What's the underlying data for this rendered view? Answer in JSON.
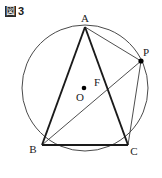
{
  "figure": {
    "caption_box_char": "図",
    "caption_number": "3",
    "type": "euclidean-geometry-diagram"
  },
  "colors": {
    "stroke": "#1a1a1a",
    "thin_stroke": "#3a3a3a",
    "circle_stroke": "#4a4a4a",
    "background": "#ffffff",
    "dot_fill": "#000000"
  },
  "geometry": {
    "circle": {
      "cx": 85,
      "cy": 88,
      "r": 63,
      "stroke_width": 1
    },
    "points": [
      {
        "name": "A",
        "x": 85,
        "y": 27,
        "label": "A",
        "label_x": 85,
        "label_y": 22,
        "dot": false
      },
      {
        "name": "B",
        "x": 42,
        "y": 145,
        "label": "B",
        "label_x": 33,
        "label_y": 153,
        "dot": false
      },
      {
        "name": "C",
        "x": 128,
        "y": 145,
        "label": "C",
        "label_x": 134,
        "label_y": 155,
        "dot": false
      },
      {
        "name": "P",
        "x": 141,
        "y": 61,
        "label": "P",
        "label_x": 146,
        "label_y": 56,
        "dot": true
      },
      {
        "name": "O",
        "x": 84,
        "y": 88,
        "label": "O",
        "label_x": 80,
        "label_y": 101,
        "dot": true
      },
      {
        "name": "F",
        "x": 104,
        "y": 88,
        "label": "F",
        "label_x": 97,
        "label_y": 86,
        "dot": false
      }
    ],
    "segments": [
      {
        "name": "AB",
        "from": "A",
        "to": "B",
        "weight": "thick"
      },
      {
        "name": "AC",
        "from": "A",
        "to": "C",
        "weight": "thick"
      },
      {
        "name": "BC",
        "from": "B",
        "to": "C",
        "weight": "thick"
      },
      {
        "name": "AP",
        "from": "A",
        "to": "P",
        "weight": "thin"
      },
      {
        "name": "BP",
        "from": "B",
        "to": "P",
        "weight": "thin"
      },
      {
        "name": "PC",
        "from": "P",
        "to": "C",
        "weight": "thin"
      }
    ]
  }
}
